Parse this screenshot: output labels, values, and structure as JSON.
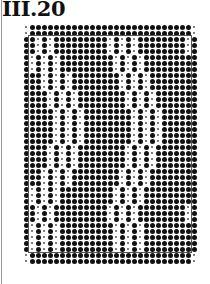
{
  "title": "III.20",
  "pattern": {
    "columns": 29,
    "rows_count": 40,
    "pitch_px": 6,
    "legend": {
      "B": "large dot",
      "S": "small dot"
    },
    "frame": {
      "from_col": 1,
      "to_col": 27,
      "from_row": 2,
      "to_row": 37,
      "color": "#555555"
    },
    "rows": [
      "SBBBBBBBBBBBBBBBBBBBBBBBBBBBS",
      "SBBBBBBBBBBBBBBBBBBBBBBBBBBBS",
      "BBSBSBBBBBBBBBSBSBSBBBBBBBBSB",
      "BBSBSBBBBBBBBBSBSBSBBBBBBBBSB",
      "BBSBSBBBBBBBBBSBSBSBBBBBBBBSB",
      "BSBSBSBBBBBBBBBSBSBSBBBBBBBBB",
      "BSBSBSBBBBBBBBBSBSBSBBBBBBBBB",
      "BSBSBSBBBBBBBBBSBSBSBBBBBBBBB",
      "BBBSBSBSBBBBBBBBSBSBSBBBBBBBB",
      "BBBSBSBSBBBBBBBBSBSBSBBBBBBBB",
      "BBBSBSBSBBBBBBBBSBSBSBBBBBBBB",
      "BBBBSBSBSBBBBBBBBSBSBSBBBBBBB",
      "BBBBSBSBSBBBBBBBBSBSBSBBBBBBB",
      "BBBBSBSBSBBBBBBBBSBSBSBBBBBBB",
      "BBBBBSBSBSBBBBBBBBSBSBSBBBBBB",
      "BBBBBSBSBSBBBBBBBBSBSBSBBBBBB",
      "BBBBBSBSBSBBBBBBBBSBSBSBBBBBB",
      "BBBBBSBSBSBBBBBBBBSBSBSBBBBBB",
      "BBBBBSBSBSBBBBBBBBSBSBSBBBBBB",
      "BBBBBSBSBSBBBBBBBBSBSBSBBBBBB",
      "BBBBSBSBSBBBBBBBBSBSBSBBBBBBB",
      "BBBBSBSBSBBBBBBBBSBSBSBBBBBBB",
      "BBBBSBSBSBBBBBBBBSBSBSBBBBBBB",
      "BBBBSBSBSBBBBBBBBSBSBSBBBBBBB",
      "BBBSBSBSBBBBBBBBSBSBSBBBBBBBB",
      "BBBSBSBSBBBBBBBBSBSBSBBBBBBBB",
      "BBBSBSBSBBBBBBBBSBSBSBBBBBBBB",
      "BSBSBSBBBBBBBBBSBSBSBBBBBBBBB",
      "BSBSBSBBBBBBBBBSBSBSBBBBBBBBB",
      "BSBSBSBBBBBBBBBSBSBSBBBBBBBBB",
      "BBSBSBBBBBBBBBSBSBSBBBBBBBBSB",
      "BBSBSBBBBBBBBBSBSBSBBBBBBBBSB",
      "BBSBSBBBBBBBBBSBSBSBBBBBBBBSB",
      "BSBSBSBBBBBBBBBSBSBSBBBBBBBBB",
      "BSBSBSBBBBBBBBBSBSBSBBBBBBBBB",
      "BSBSBSBBBBBBBBBSBSBSBBBBBBBBB",
      "BSBSBSBBBBBBBBBSBSBSBBBBBBBBB",
      "BSBSBSBBBBBBBBBSBSBSBBBBBBBBB",
      "SBBBBBBBBBBBBBBBBBBBBBBBBBBBS",
      "SBBBBBBBBBBBBBBBBBBBBBBBBBBBS"
    ]
  }
}
